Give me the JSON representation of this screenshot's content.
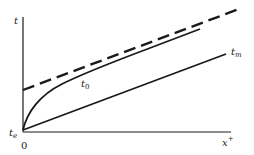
{
  "diagram": {
    "type": "line-plot-schematic",
    "axes": {
      "y_label": "t",
      "x_label_base": "x",
      "x_label_sup": "+",
      "origin_label": "0",
      "y_intercept_label_base": "t",
      "y_intercept_label_sub": "e"
    },
    "curves": [
      {
        "id": "t0",
        "label_base": "t",
        "label_sub": "0",
        "style": "solid-curve"
      },
      {
        "id": "tm",
        "label_base": "t",
        "label_sub": "m",
        "style": "solid-line"
      },
      {
        "id": "asymptote",
        "label_base": "",
        "label_sub": "",
        "style": "dashed-line"
      }
    ],
    "colors": {
      "ink": "#1a1a1a",
      "background": "#ffffff"
    }
  }
}
